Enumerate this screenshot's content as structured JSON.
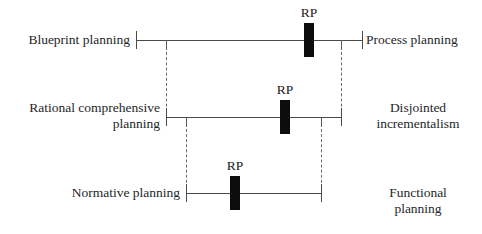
{
  "diagram": {
    "marker_label": "RP",
    "line_color": "#4a4a4a",
    "dash_color": "#6a6a6a",
    "marker_color": "#0d0d0d",
    "text_color": "#262626",
    "rows": [
      {
        "id": "row-1",
        "left_label": "Blueprint planning",
        "right_label": "Process planning",
        "marker": "RP",
        "axis_y": 40,
        "axis_x1": 136,
        "axis_x2": 362,
        "marker_x": 309,
        "left_dash_x": 166,
        "right_dash_x": 341
      },
      {
        "id": "row-2",
        "left_label": "Rational comprehensive\nplanning",
        "right_label": "Disjointed\nincrementalism",
        "marker": "RP",
        "axis_y": 117,
        "axis_x1": 166,
        "axis_x2": 341,
        "marker_x": 285,
        "left_dash_x": 186,
        "right_dash_x": 321
      },
      {
        "id": "row-3",
        "left_label": "Normative planning",
        "right_label": "Functional\nplanning",
        "marker": "RP",
        "axis_y": 193,
        "axis_x1": 186,
        "axis_x2": 321,
        "marker_x": 235,
        "left_dash_x": null,
        "right_dash_x": null
      }
    ]
  }
}
